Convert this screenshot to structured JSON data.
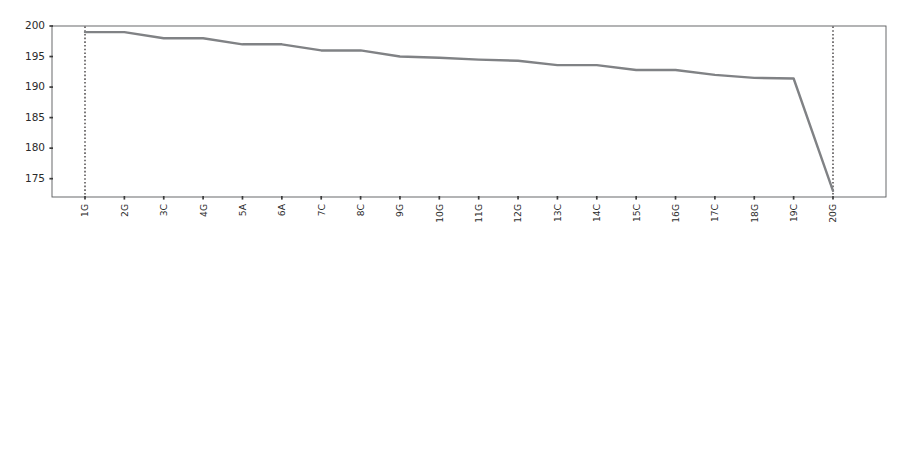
{
  "figure": {
    "background_color": "#ffffff",
    "line_color": "#808285",
    "frame_color": "#58595b",
    "marker_line_color": "#231f20",
    "tick_color": "#3b3b3b",
    "panel_count": 2
  },
  "chart_data": [
    {
      "id": "top-panel",
      "type": "line",
      "title": "",
      "xlabel": "",
      "ylabel": "",
      "grid": false,
      "legend": null,
      "ylim": [
        172,
        200
      ],
      "yticks": [
        175,
        180,
        185,
        190,
        195,
        200
      ],
      "ytick_labels": [
        "175",
        "180",
        "185",
        "190",
        "195",
        "200"
      ],
      "categories": [
        "1G",
        "2G",
        "3C",
        "4G",
        "5A",
        "6A",
        "7C",
        "8C",
        "9G",
        "10G",
        "11G",
        "12G",
        "13C",
        "14C",
        "15C",
        "16G",
        "17C",
        "18G",
        "19C",
        "20G"
      ],
      "values": [
        199.0,
        199.0,
        198.0,
        198.0,
        197.0,
        197.0,
        196.0,
        196.0,
        195.0,
        194.8,
        194.5,
        194.3,
        193.6,
        193.6,
        192.8,
        192.8,
        192.0,
        191.5,
        191.4,
        173.0
      ],
      "annotations": [
        {
          "kind": "vertical-dotted-line",
          "at_category": "1G",
          "style": "dotted"
        },
        {
          "kind": "vertical-dotted-line",
          "at_category": "20G",
          "style": "dotted"
        }
      ]
    },
    {
      "id": "bottom-panel",
      "type": "line",
      "title": "",
      "xlabel": "",
      "ylabel": "",
      "grid": false,
      "legend": null,
      "ylim": [
        1436,
        1532
      ],
      "yticks": [
        1440,
        1460,
        1480,
        1500,
        1520
      ],
      "ytick_labels": [
        "1440",
        "1460",
        "1480",
        "1500",
        "1520"
      ],
      "categories": [
        "10G",
        "11C",
        "12A",
        "13A",
        "14T",
        "15C",
        "16C",
        "17T",
        "18A",
        "19A",
        "20A",
        "21C",
        "22G",
        "23G",
        "24T",
        "25T",
        "26C",
        "27C",
        "28C",
        "29G",
        "30G",
        "31G",
        "32C",
        "33G",
        "34A",
        "35A",
        "36C",
        "37C",
        "38G",
        "39G",
        "40G",
        "41G",
        "42C",
        "43C",
        "44C",
        "45G",
        "46C",
        "47G",
        "48C",
        "49G",
        "50C",
        "51G",
        "52C",
        "53C",
        "54A",
        "55A",
        "56G",
        "57G",
        "58C",
        "59C",
        "60G",
        "61C",
        "62C",
        "63G",
        "64A",
        "65G",
        "66A",
        "67C",
        "68C",
        "69C"
      ],
      "values": [
        1529.0,
        1527.5,
        1526.8,
        1526.5,
        1526.2,
        1525.0,
        1524.8,
        1524.5,
        1524.2,
        1524.0,
        1517.8,
        1517.8,
        1517.7,
        1517.6,
        1517.5,
        1517.4,
        1517.2,
        1516.8,
        1516.6,
        1516.2,
        1515.5,
        1514.8,
        1514.2,
        1513.8,
        1513.4,
        1500.2,
        1500.0,
        1497.0,
        1496.8,
        1496.8,
        1496.6,
        1496.5,
        1496.4,
        1496.3,
        1496.2,
        1495.5,
        1489.0,
        1475.0,
        1475.0,
        1474.8,
        1474.5,
        1474.0,
        1459.0,
        1455.5,
        1455.4,
        1455.3,
        1455.4,
        1455.3,
        1455.0,
        1454.8,
        1454.6,
        1452.0,
        1448.0,
        1447.5,
        1447.2,
        1446.6,
        1445.8,
        1444.8,
        1442.5,
        1442.4
      ],
      "annotations": [
        {
          "kind": "vertical-dotted-line",
          "at_category": "30G",
          "style": "dotted"
        },
        {
          "kind": "vertical-dotted-line",
          "at_category": "49G",
          "style": "dotted"
        }
      ]
    }
  ]
}
